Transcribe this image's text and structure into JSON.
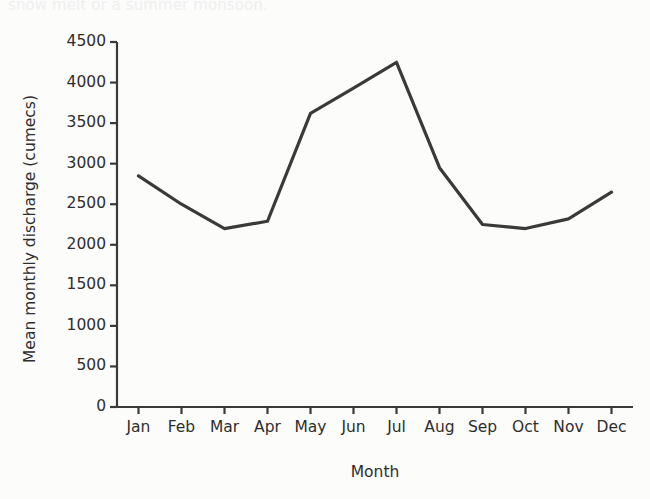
{
  "caption": {
    "top_text": "snow melt or a summer monsoon."
  },
  "chart_data": {
    "type": "line",
    "title": "",
    "xlabel": "Month",
    "ylabel": "Mean monthly discharge (cumecs)",
    "categories": [
      "Jan",
      "Feb",
      "Mar",
      "Apr",
      "May",
      "Jun",
      "Jul",
      "Aug",
      "Sep",
      "Oct",
      "Nov",
      "Dec"
    ],
    "values": [
      2850,
      2500,
      2200,
      2290,
      3620,
      3930,
      4250,
      2950,
      2250,
      2200,
      2320,
      2650
    ],
    "series": [
      {
        "name": "Mean monthly discharge",
        "values": [
          2850,
          2500,
          2200,
          2290,
          3620,
          3930,
          4250,
          2950,
          2250,
          2200,
          2320,
          2650
        ]
      }
    ],
    "ylim": [
      0,
      4500
    ],
    "yticks": [
      0,
      500,
      1000,
      1500,
      2000,
      2500,
      3000,
      3500,
      4000,
      4500
    ],
    "ytick_labels": [
      "0",
      "500",
      "1000",
      "1500",
      "2000",
      "2500",
      "3000",
      "3500",
      "4000",
      "4500"
    ],
    "grid": false,
    "legend": false,
    "line_color": "#3a3a3a",
    "axis_color": "#3a3a3a",
    "background": "#fcfcfa"
  }
}
